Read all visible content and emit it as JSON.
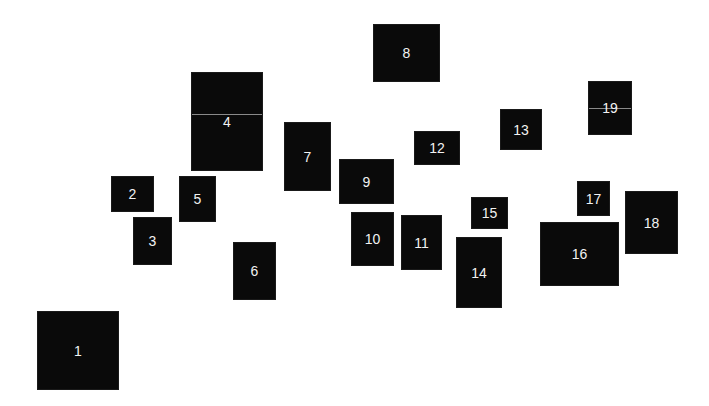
{
  "diagram": {
    "background": "#ffffff",
    "box_color": "#0a0a0a",
    "label_color": "#f2f2f2",
    "boxes": [
      {
        "label": "1",
        "x": 37,
        "y": 311,
        "w": 82,
        "h": 79
      },
      {
        "label": "2",
        "x": 111,
        "y": 176,
        "w": 43,
        "h": 36
      },
      {
        "label": "3",
        "x": 133,
        "y": 217,
        "w": 39,
        "h": 48
      },
      {
        "label": "4",
        "x": 191,
        "y": 72,
        "w": 72,
        "h": 99,
        "divider_y": 41
      },
      {
        "label": "5",
        "x": 179,
        "y": 176,
        "w": 37,
        "h": 46
      },
      {
        "label": "6",
        "x": 233,
        "y": 242,
        "w": 43,
        "h": 58
      },
      {
        "label": "7",
        "x": 284,
        "y": 122,
        "w": 47,
        "h": 69
      },
      {
        "label": "8",
        "x": 373,
        "y": 24,
        "w": 67,
        "h": 58
      },
      {
        "label": "9",
        "x": 339,
        "y": 159,
        "w": 55,
        "h": 45
      },
      {
        "label": "10",
        "x": 351,
        "y": 212,
        "w": 43,
        "h": 54
      },
      {
        "label": "11",
        "x": 401,
        "y": 215,
        "w": 41,
        "h": 55
      },
      {
        "label": "12",
        "x": 414,
        "y": 131,
        "w": 46,
        "h": 34
      },
      {
        "label": "13",
        "x": 500,
        "y": 109,
        "w": 42,
        "h": 41
      },
      {
        "label": "14",
        "x": 456,
        "y": 237,
        "w": 46,
        "h": 71
      },
      {
        "label": "15",
        "x": 471,
        "y": 197,
        "w": 37,
        "h": 32
      },
      {
        "label": "16",
        "x": 540,
        "y": 222,
        "w": 79,
        "h": 64
      },
      {
        "label": "17",
        "x": 577,
        "y": 181,
        "w": 33,
        "h": 35
      },
      {
        "label": "18",
        "x": 625,
        "y": 191,
        "w": 53,
        "h": 63
      },
      {
        "label": "19",
        "x": 588,
        "y": 81,
        "w": 44,
        "h": 54,
        "divider_y": 26
      }
    ]
  }
}
